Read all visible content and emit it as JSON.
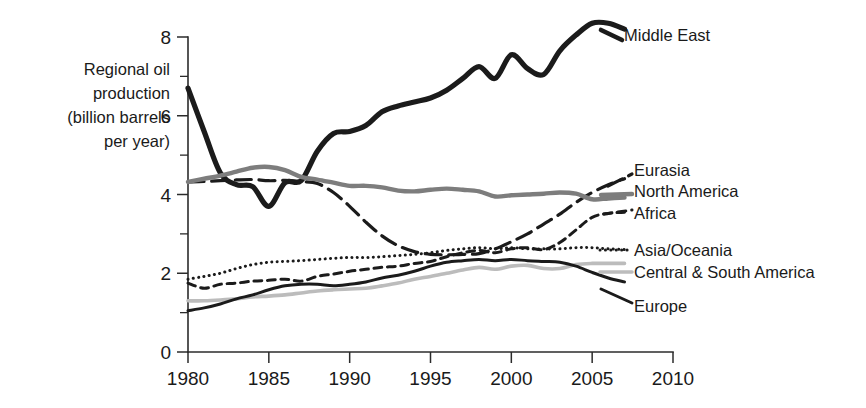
{
  "axis_title_lines": "Regional oil\nproduction\n(billion barrels\nper year)",
  "axis": {
    "y_ticks_major": [
      "0",
      "2",
      "4",
      "6",
      "8"
    ],
    "x_ticks": [
      "1980",
      "1985",
      "1990",
      "1995",
      "2000",
      "2005",
      "2010"
    ]
  },
  "labels": {
    "middle_east": "Middle East",
    "eurasia": "Eurasia",
    "north_america": "North America",
    "africa": "Africa",
    "asia_oceania": "Asia/Oceania",
    "central_south_america": "Central & South America",
    "europe": "Europe"
  },
  "colors": {
    "dark": "#1b1b1b",
    "gray": "#7d7d7d",
    "light_gray": "#bcbcbc",
    "axis": "#2b2b2b",
    "background": "#ffffff"
  },
  "chart_data": {
    "type": "line",
    "title": "",
    "subtitle": "",
    "xlabel": "",
    "ylabel": "Regional oil production (billion barrels per year)",
    "xlim": [
      1980,
      2010
    ],
    "ylim": [
      0,
      8
    ],
    "y_tick_step_major": 2,
    "y_tick_step_minor": 1,
    "x_tick_step": 5,
    "grid": false,
    "legend_position": "right-inline-labels",
    "x": [
      1980,
      1981,
      1982,
      1983,
      1984,
      1985,
      1986,
      1987,
      1988,
      1989,
      1990,
      1991,
      1992,
      1993,
      1994,
      1995,
      1996,
      1997,
      1998,
      1999,
      2000,
      2001,
      2002,
      2003,
      2004,
      2005,
      2006,
      2007
    ],
    "series": [
      {
        "name": "Middle East",
        "style": "solid",
        "width": 5.2,
        "color": "#1b1b1b",
        "values": [
          6.7,
          5.6,
          4.55,
          4.25,
          4.2,
          3.7,
          4.3,
          4.35,
          5.1,
          5.55,
          5.6,
          5.75,
          6.1,
          6.25,
          6.35,
          6.45,
          6.65,
          6.95,
          7.25,
          6.95,
          7.55,
          7.2,
          7.05,
          7.65,
          8.05,
          8.35,
          8.35,
          8.2
        ]
      },
      {
        "name": "Eurasia",
        "style": "long-dash",
        "width": 3.2,
        "color": "#1b1b1b",
        "values": [
          4.32,
          4.33,
          4.35,
          4.37,
          4.38,
          4.35,
          4.36,
          4.33,
          4.28,
          4.05,
          3.7,
          3.3,
          2.95,
          2.7,
          2.55,
          2.48,
          2.47,
          2.48,
          2.5,
          2.62,
          2.8,
          3.0,
          3.25,
          3.5,
          3.8,
          4.05,
          4.25,
          4.4
        ]
      },
      {
        "name": "North America",
        "style": "solid",
        "width": 4.4,
        "color": "#7d7d7d",
        "values": [
          4.32,
          4.4,
          4.48,
          4.58,
          4.68,
          4.7,
          4.62,
          4.45,
          4.38,
          4.3,
          4.22,
          4.22,
          4.18,
          4.1,
          4.08,
          4.12,
          4.15,
          4.12,
          4.08,
          3.95,
          3.98,
          4.0,
          4.02,
          4.05,
          4.02,
          3.88,
          3.9,
          3.92
        ]
      },
      {
        "name": "Africa",
        "style": "short-dash",
        "width": 3.0,
        "color": "#1b1b1b",
        "values": [
          1.75,
          1.62,
          1.72,
          1.75,
          1.8,
          1.82,
          1.85,
          1.8,
          1.92,
          1.98,
          2.05,
          2.1,
          2.15,
          2.18,
          2.25,
          2.3,
          2.42,
          2.52,
          2.58,
          2.52,
          2.62,
          2.65,
          2.6,
          2.78,
          3.1,
          3.42,
          3.52,
          3.55
        ]
      },
      {
        "name": "Asia/Oceania",
        "style": "dotted",
        "width": 3.0,
        "color": "#1b1b1b",
        "values": [
          1.85,
          1.92,
          2.0,
          2.12,
          2.22,
          2.28,
          2.3,
          2.32,
          2.35,
          2.38,
          2.4,
          2.4,
          2.42,
          2.45,
          2.48,
          2.52,
          2.58,
          2.62,
          2.65,
          2.62,
          2.65,
          2.62,
          2.62,
          2.62,
          2.65,
          2.65,
          2.62,
          2.6
        ]
      },
      {
        "name": "Central & South America",
        "style": "solid",
        "width": 3.6,
        "color": "#bcbcbc",
        "values": [
          1.3,
          1.3,
          1.32,
          1.35,
          1.4,
          1.42,
          1.45,
          1.5,
          1.55,
          1.58,
          1.6,
          1.62,
          1.68,
          1.75,
          1.85,
          1.92,
          2.0,
          2.08,
          2.15,
          2.1,
          2.18,
          2.2,
          2.12,
          2.12,
          2.22,
          2.25,
          2.25,
          2.25
        ]
      },
      {
        "name": "Europe",
        "style": "solid",
        "width": 3.0,
        "color": "#1b1b1b",
        "values": [
          1.05,
          1.12,
          1.22,
          1.35,
          1.45,
          1.58,
          1.68,
          1.72,
          1.72,
          1.68,
          1.72,
          1.78,
          1.88,
          1.95,
          2.05,
          2.18,
          2.28,
          2.32,
          2.35,
          2.32,
          2.35,
          2.32,
          2.3,
          2.28,
          2.18,
          2.02,
          1.88,
          1.78
        ]
      }
    ]
  }
}
